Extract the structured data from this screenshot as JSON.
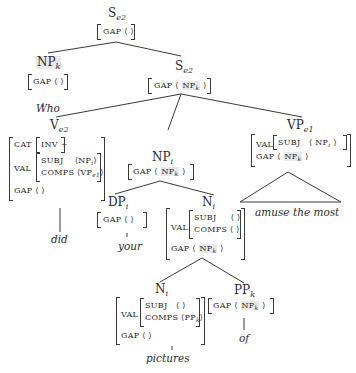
{
  "tree": {
    "root": {
      "cat": "S",
      "sub": "e2",
      "gap": "GAP",
      "gap_val": "⟨ ⟩"
    },
    "np_who": {
      "cat": "NP",
      "sub": "k",
      "gap": "GAP",
      "gap_val": "⟨ ⟩",
      "word": "Who"
    },
    "s_inner": {
      "cat": "S",
      "sub": "e2",
      "gap": "GAP",
      "gap_open": "⟨",
      "gap_np": "NP",
      "gap_np_sub": "k",
      "gap_close": "⟩"
    },
    "v": {
      "cat": "V",
      "sub": "e2",
      "cat_feat": "CAT",
      "inv": "INV +",
      "val": "VAL",
      "subj": "SUBJ",
      "subj_val": "⟨NP",
      "subj_sub": "i",
      "subj_close": "⟩",
      "comps": "COMPS",
      "comps_val": "⟨VP",
      "comps_sub": "e1",
      "comps_close": "⟩",
      "gap": "GAP",
      "gap_val": "⟨ ⟩",
      "word": "did"
    },
    "np_i": {
      "cat": "NP",
      "sub": "i",
      "gap": "GAP",
      "gap_open": "⟨",
      "gap_np": "NP",
      "gap_np_sub": "k",
      "gap_close": "⟩"
    },
    "vp": {
      "cat": "VP",
      "sub": "e1",
      "val": "VAL",
      "subj": "SUBJ",
      "subj_open": "⟨ NP",
      "subj_sub": "i",
      "subj_close": "⟩",
      "gap": "GAP",
      "gap_open": "⟨",
      "gap_np": "NP",
      "gap_np_sub": "k",
      "gap_close": "⟩",
      "word": "amuse the most"
    },
    "dp": {
      "cat": "DP",
      "sub": "i",
      "gap": "GAP",
      "gap_val": "⟨ ⟩",
      "word": "your"
    },
    "n_bar": {
      "cat": "N",
      "sub": "i",
      "val": "VAL",
      "subj": "SUBJ",
      "subj_val": "⟨ ⟩",
      "comps": "COMPS",
      "comps_val": "⟨ ⟩",
      "gap": "GAP",
      "gap_open": "⟨",
      "gap_np": "NP",
      "gap_np_sub": "k",
      "gap_close": "⟩"
    },
    "n_low": {
      "cat": "N",
      "sub": "i",
      "val": "VAL",
      "subj": "SUBJ",
      "subj_val": "⟨ ⟩",
      "comps": "COMPS",
      "comps_val": "⟨PP",
      "comps_sub": "k",
      "comps_close": "⟩",
      "gap": "GAP",
      "gap_val": "⟨ ⟩",
      "word": "pictures"
    },
    "pp": {
      "cat": "PP",
      "sub": "k",
      "gap": "GAP",
      "gap_open": "⟨",
      "gap_np": "NP",
      "gap_np_sub": "k",
      "gap_close": "⟩",
      "word": "of"
    }
  },
  "colors": {
    "line": "#3a3a3a",
    "highlight": "#e9e9e9",
    "text": "#2b2b2b"
  }
}
